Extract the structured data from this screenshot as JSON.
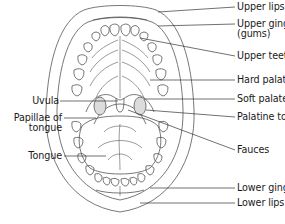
{
  "diagram": {
    "labels_right": [
      {
        "id": "upper-lips",
        "text": "Upper lips"
      },
      {
        "id": "upper-gingiva",
        "text": "Upper gingiva",
        "text2": "(gums)"
      },
      {
        "id": "upper-teeth",
        "text": "Upper teeth"
      },
      {
        "id": "hard-palate",
        "text": "Hard palate"
      },
      {
        "id": "soft-palate",
        "text": "Soft palate"
      },
      {
        "id": "palatine-tonsil",
        "text": "Palatine tonsil"
      },
      {
        "id": "fauces",
        "text": "Fauces"
      },
      {
        "id": "lower-gingiva",
        "text": "Lower gingiva"
      },
      {
        "id": "lower-lips",
        "text": "Lower lips"
      }
    ],
    "labels_left": [
      {
        "id": "uvula",
        "text": "Uvula"
      },
      {
        "id": "papillae-of-tongue",
        "text": "Papillae of",
        "text2": "tongue"
      },
      {
        "id": "tongue",
        "text": "Tongue"
      }
    ],
    "colors": {
      "line": "#555555",
      "text": "#1a1a1a",
      "background": "#ffffff",
      "tonsil_fill": "#d9d9d9"
    }
  }
}
